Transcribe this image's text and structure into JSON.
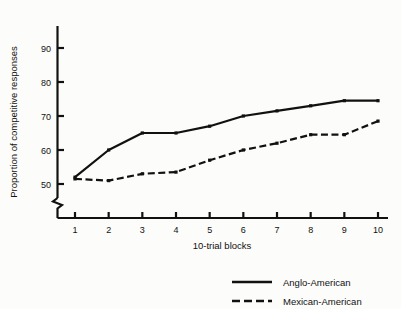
{
  "figure": {
    "background_color": "#fcfcfa",
    "ink_color": "#111111"
  },
  "chart_data": {
    "type": "line",
    "title": "",
    "subtitle": "",
    "xlabel": "10-trial blocks",
    "ylabel": "Proportion of competitive responses",
    "x": [
      1,
      2,
      3,
      4,
      5,
      6,
      7,
      8,
      9,
      10
    ],
    "categories": [
      "1",
      "2",
      "3",
      "4",
      "5",
      "6",
      "7",
      "8",
      "9",
      "10"
    ],
    "xtick_labels": [
      "1",
      "2",
      "3",
      "4",
      "5",
      "6",
      "7",
      "8",
      "9",
      "10"
    ],
    "ytick_labels": [
      "50",
      "60",
      "70",
      "80",
      "90"
    ],
    "yticks": [
      50,
      60,
      70,
      80,
      90
    ],
    "xlim": [
      0.55,
      10.45
    ],
    "ylim": [
      47,
      96
    ],
    "y_axis_break": true,
    "grid": false,
    "legend_position": "bottom-right",
    "series": [
      {
        "name": "Anglo-American",
        "style": "solid",
        "color": "#111111",
        "values": [
          52,
          60,
          65,
          65,
          67,
          70,
          71.5,
          73,
          74.5,
          74.5
        ]
      },
      {
        "name": "Mexican-American",
        "style": "dashed",
        "color": "#111111",
        "values": [
          51.5,
          51,
          53,
          53.5,
          57,
          60,
          62,
          64.5,
          64.5,
          68.5
        ]
      }
    ]
  },
  "legend": {
    "entries": [
      {
        "label": "Anglo-American",
        "style": "solid"
      },
      {
        "label": "Mexican-American",
        "style": "dashed"
      }
    ]
  }
}
